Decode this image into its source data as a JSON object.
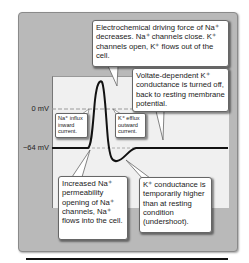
{
  "diagram": {
    "axis": {
      "zero_label": "0 mV",
      "rest_label": "−64 mV"
    },
    "callouts": {
      "top": "Electrochemical driving force of Na⁺ decreases. Na⁺ channels close. K⁺ channels open, K⁺ flows out of the cell.",
      "repolarize": "Voltate-dependent K⁺ conductance is turned off, back to resting membrane potential.",
      "na_influx": "Na⁺ influx inward current.",
      "k_efflux": "K⁺ efflux outward current.",
      "depolarize": "Increased Na⁺ permeability opening of Na⁺ channels, Na⁺ flows into the cell.",
      "undershoot": "K⁺ conductance is temporarily higher than at resting condition (undershoot)."
    },
    "colors": {
      "panel": "#b9b9b9",
      "plot": "#f0f0f0",
      "trace": "#111111",
      "callout_bg": "#ffffff"
    }
  }
}
